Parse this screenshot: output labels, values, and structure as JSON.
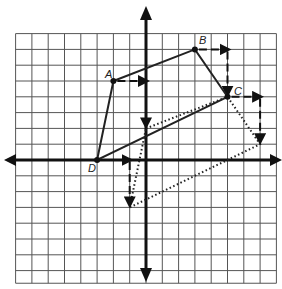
{
  "diagram": {
    "type": "coordinate-plane-translation",
    "grid": {
      "columns": 16,
      "rows": 16,
      "origin_px": [
        146,
        160
      ],
      "cell_px": [
        16.3,
        15.8
      ]
    },
    "colors": {
      "grid": "#555555",
      "axis": "#111111",
      "figure": "#222222",
      "background": "#ffffff"
    },
    "original_figure": {
      "name": "ABCD",
      "style": "solid",
      "points": [
        {
          "label": "A",
          "x": -2,
          "y": 5
        },
        {
          "label": "B",
          "x": 3,
          "y": 7
        },
        {
          "label": "C",
          "x": 5,
          "y": 4
        },
        {
          "label": "D",
          "x": -3,
          "y": 0
        }
      ]
    },
    "translation": {
      "right": 2,
      "down": 3,
      "arrow_style": "dashed"
    },
    "image_figure": {
      "name": "A'B'C'D'",
      "style": "dotted",
      "points": [
        {
          "label": "A'",
          "x": 0,
          "y": 2
        },
        {
          "label": "B'",
          "x": 5,
          "y": 4
        },
        {
          "label": "C'",
          "x": 7,
          "y": 1
        },
        {
          "label": "D'",
          "x": -1,
          "y": -3
        }
      ]
    },
    "labels": {
      "A": "A",
      "B": "B",
      "C": "C",
      "D": "D"
    }
  }
}
